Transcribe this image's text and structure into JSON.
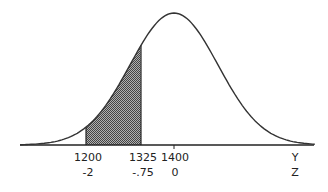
{
  "chart_data": {
    "type": "area",
    "title": "",
    "mean": 1400,
    "sd": 100,
    "xlabel": "Y",
    "xlabel2": "Z",
    "ticks": [
      {
        "y": "1200",
        "z": "-2"
      },
      {
        "y": "1325",
        "z": "-.75"
      },
      {
        "y": "1400",
        "z": "0"
      }
    ],
    "shaded_region": {
      "from_y": 1200,
      "to_y": 1325,
      "from_z": -2,
      "to_z": -0.75
    },
    "axis_labels": {
      "y": "Y",
      "z": "Z"
    },
    "colors": {
      "curve": "#333333",
      "shade": "#7a7a7a",
      "axis": "#222222"
    }
  }
}
